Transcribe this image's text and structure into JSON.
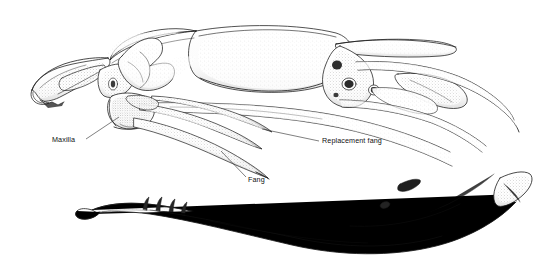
{
  "figure": {
    "view": "lateral",
    "width": 540,
    "height": 259,
    "background_color": "#ffffff",
    "ink_color": "#1a1a1a",
    "style": "pen-and-ink stipple line drawing"
  },
  "labels": [
    {
      "id": "maxilla",
      "text": "Maxilla",
      "x": 52,
      "y": 135,
      "leader": {
        "x1": 86,
        "y1": 139,
        "x2": 119,
        "y2": 117
      }
    },
    {
      "id": "replacement_fang",
      "text": "Replacement fang",
      "x": 322,
      "y": 136,
      "leader": {
        "x1": 319,
        "y1": 141,
        "x2": 262,
        "y2": 129
      }
    },
    {
      "id": "fang",
      "text": "Fang",
      "x": 248,
      "y": 175,
      "leader": {
        "x1": 246,
        "y1": 177,
        "x2": 221,
        "y2": 151
      }
    }
  ],
  "anatomy": {
    "parts": [
      "premaxilla",
      "nasal",
      "prefrontal",
      "frontal",
      "parietal braincase",
      "maxilla",
      "ectopterygoid",
      "pterygoid",
      "palatine",
      "quadrate",
      "supratemporal",
      "fang",
      "replacement fang",
      "mandible",
      "dentary teeth",
      "mental foramen"
    ]
  }
}
